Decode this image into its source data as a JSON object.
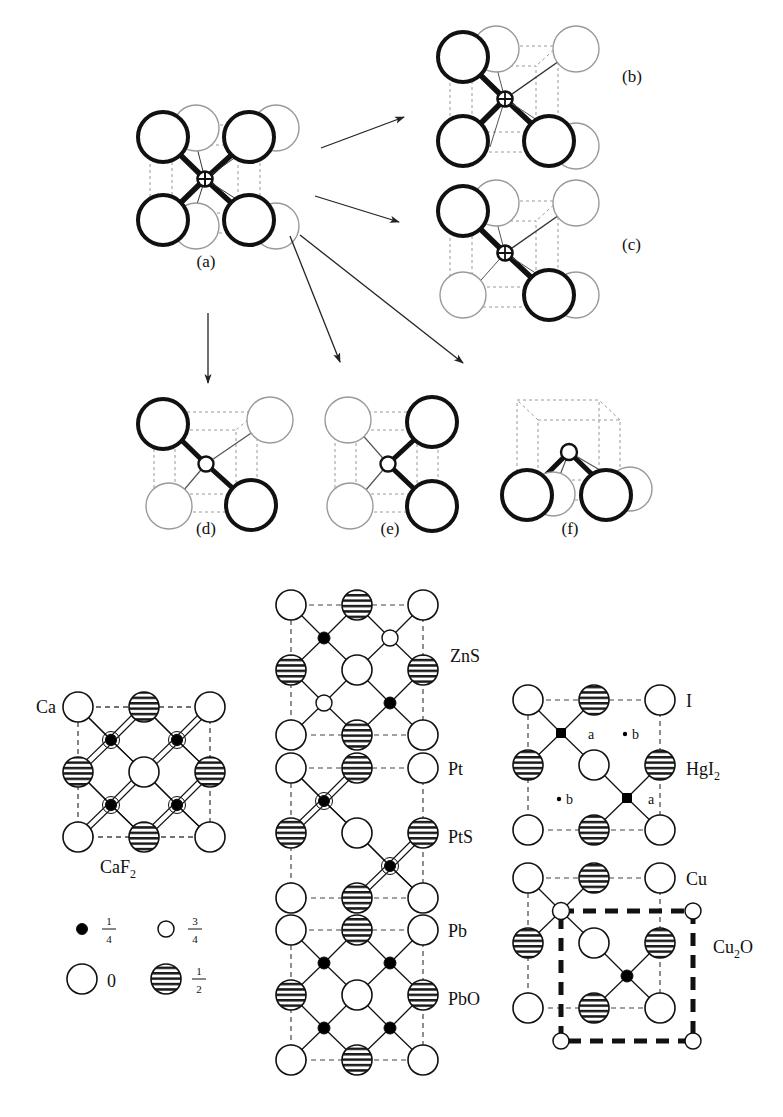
{
  "figure": {
    "panel_labels": {
      "a": "(a)",
      "b": "(b)",
      "c": "(c)",
      "d": "(d)",
      "e": "(e)",
      "f": "(f)"
    }
  },
  "structures": {
    "caf2": {
      "cation_label": "Ca",
      "formula": "CaF",
      "formula_sub": "2",
      "interior_sites": [
        "quarter",
        "quarter",
        "quarter",
        "quarter"
      ],
      "interior_bonded": [
        true,
        true,
        true,
        true
      ]
    },
    "zns": {
      "formula": "ZnS",
      "interior_sites": [
        "quarter",
        "three-quarter",
        "three-quarter",
        "quarter"
      ],
      "interior_bonded": [
        true,
        true,
        true,
        true
      ]
    },
    "pts": {
      "anion_label": "Pt",
      "formula": "PtS",
      "interior_sites": [
        "quarter",
        "empty",
        "empty",
        "quarter"
      ],
      "interior_bonded": [
        true,
        false,
        false,
        true
      ]
    },
    "pbo": {
      "anion_label": "Pb",
      "formula": "PbO",
      "interior_sites": [
        "quarter",
        "quarter",
        "quarter",
        "quarter"
      ],
      "interior_bonded": [
        true,
        true,
        true,
        true
      ]
    },
    "hgi2": {
      "anion_label": "I",
      "formula": "HgI",
      "formula_sub": "2",
      "site_a_label": "a",
      "site_b_label": "b",
      "interior_sites": [
        "quarter",
        "vacancy",
        "vacancy",
        "quarter"
      ]
    },
    "cu2o": {
      "anion_label": "Cu",
      "formula": "Cu",
      "formula_sub": "2",
      "formula_tail": "O",
      "interior_sites": [
        "three-quarter",
        "empty",
        "empty",
        "quarter"
      ]
    }
  },
  "legend": {
    "items": [
      {
        "symbol": "small-filled-circle",
        "num": "1",
        "den": "4"
      },
      {
        "symbol": "small-open-circle",
        "num": "3",
        "den": "4"
      },
      {
        "symbol": "large-open-circle",
        "value": "0"
      },
      {
        "symbol": "large-hatched-circle",
        "num": "1",
        "den": "2"
      }
    ]
  },
  "colors": {
    "ink": "#111111",
    "hatch": "#222222",
    "ghost": "#8a8a8a",
    "dash": "#555555"
  }
}
